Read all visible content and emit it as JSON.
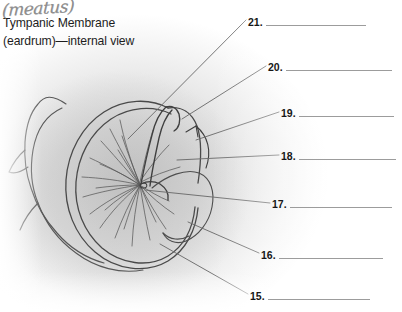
{
  "page": {
    "width": 402,
    "height": 312,
    "background_color": "#ffffff",
    "paper_tint_color": "#d2d2d2",
    "ink_color": "#4a4a4a",
    "text_color": "#1d1d1d",
    "rule_color": "#9c9c9c"
  },
  "caption": {
    "line1": "Tympanic Membrane",
    "line2": "(eardrum)—internal view"
  },
  "annotation": {
    "handwritten_note": "(meatus)",
    "ink_color": "#8e8e8e"
  },
  "figure": {
    "name": "tympanic-membrane-internal-view",
    "style": "pencil-sketch",
    "leader_line_count": 7
  },
  "answer_blanks": [
    {
      "number": "21.",
      "x": 248,
      "y": 17,
      "rule_width": 100
    },
    {
      "number": "20.",
      "x": 268,
      "y": 62,
      "rule_width": 106
    },
    {
      "number": "19.",
      "x": 281,
      "y": 108,
      "rule_width": 95
    },
    {
      "number": "18.",
      "x": 281,
      "y": 151,
      "rule_width": 97
    },
    {
      "number": "17.",
      "x": 272,
      "y": 199,
      "rule_width": 102
    },
    {
      "number": "16.",
      "x": 261,
      "y": 250,
      "rule_width": 104
    },
    {
      "number": "15.",
      "x": 250,
      "y": 291,
      "rule_width": 102
    }
  ]
}
